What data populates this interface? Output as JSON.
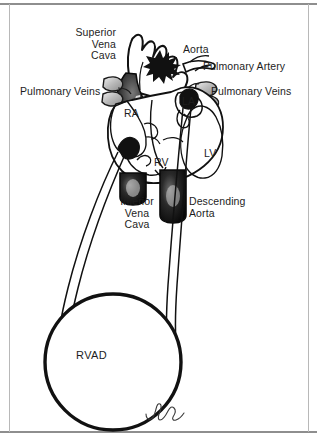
{
  "figure": {
    "signature": "artist-signature",
    "colors": {
      "ink": "#1d1d1d",
      "fill_white": "#ffffff",
      "fill_black": "#111111",
      "frame": "#8e8e8e",
      "background": "#ffffff"
    }
  },
  "labels": {
    "superior_vena_cava": "Superior\nVena\nCava",
    "aorta": "Aorta",
    "pulmonary_artery": "Pulmonary Artery",
    "pulmonary_veins_left": "Pulmonary Veins",
    "pulmonary_veins_right": "Pulmonary Veins",
    "inferior_vena_cava": "Inferior\nVena\nCava",
    "descending_aorta": "Descending\nAorta",
    "right_atrium": "RA",
    "right_ventricle": "RV",
    "left_atrium": "LA",
    "left_ventricle": "LV",
    "device": "RVAD"
  },
  "structures": [
    {
      "name": "superior-vena-cava",
      "label": "Superior Vena Cava",
      "shading": "black"
    },
    {
      "name": "aorta",
      "label": "Aorta",
      "shading": "outline"
    },
    {
      "name": "pulmonary-artery",
      "label": "Pulmonary Artery",
      "shading": "outline"
    },
    {
      "name": "pulmonary-veins-left",
      "label": "Pulmonary Veins",
      "shading": "gray"
    },
    {
      "name": "pulmonary-veins-right",
      "label": "Pulmonary Veins",
      "shading": "gray"
    },
    {
      "name": "inferior-vena-cava",
      "label": "Inferior Vena Cava",
      "shading": "black"
    },
    {
      "name": "descending-aorta",
      "label": "Descending Aorta",
      "shading": "black"
    },
    {
      "name": "right-atrium",
      "label": "RA",
      "shading": "outline"
    },
    {
      "name": "right-ventricle",
      "label": "RV",
      "shading": "outline"
    },
    {
      "name": "left-atrium",
      "label": "LA",
      "shading": "outline"
    },
    {
      "name": "left-ventricle",
      "label": "LV",
      "shading": "outline"
    },
    {
      "name": "rvad-pump",
      "label": "RVAD",
      "shading": "outline"
    },
    {
      "name": "inflow-cannula",
      "label": "Inflow cannula from right atrium to RVAD",
      "shading": "outline"
    },
    {
      "name": "outflow-cannula",
      "label": "Outflow cannula from RVAD to pulmonary artery",
      "shading": "outline"
    }
  ]
}
